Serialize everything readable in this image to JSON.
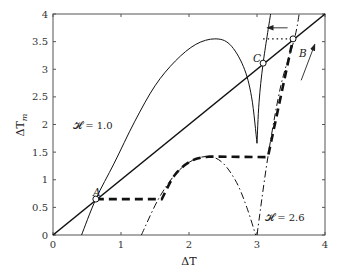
{
  "chart_data": {
    "type": "line",
    "title": "",
    "xlabel": "ΔT",
    "ylabel": "ΔT_m",
    "xlim": [
      0,
      4
    ],
    "ylim": [
      0,
      4
    ],
    "xticks": [
      0,
      1,
      2,
      3,
      4
    ],
    "xtick_labels": [
      "0",
      "1",
      "2",
      "3",
      "4"
    ],
    "yticks": [
      0,
      0.5,
      1,
      1.5,
      2,
      2.5,
      3,
      3.5,
      4
    ],
    "ytick_labels": [
      "0",
      "0.5",
      "1",
      "1.5",
      "2",
      "2.5",
      "3",
      "3.5",
      "4"
    ],
    "grid": false,
    "legend": null,
    "series": [
      {
        "name": "diagonal ΔT_m = ΔT",
        "style": "solid-thick",
        "x": [
          0,
          4
        ],
        "y": [
          0,
          4
        ]
      },
      {
        "name": "H = 1.0 (solid curve)",
        "style": "solid-thin",
        "x": [
          0.42,
          0.63,
          0.9,
          1.2,
          1.5,
          1.8,
          2.1,
          2.38,
          2.6,
          2.8,
          2.92,
          3.0
        ],
        "y": [
          0.0,
          0.65,
          1.3,
          2.05,
          2.7,
          3.15,
          3.45,
          3.55,
          3.45,
          3.05,
          2.5,
          1.66
        ]
      },
      {
        "name": "H = 1.0 (right branch)",
        "style": "solid-thin",
        "x": [
          3.0,
          3.03,
          3.09,
          3.2
        ],
        "y": [
          1.66,
          2.4,
          3.11,
          4.0
        ]
      },
      {
        "name": "H = 2.6 (dash-dot curve)",
        "style": "dash-dot",
        "x": [
          1.3,
          1.55,
          1.8,
          2.05,
          2.3,
          2.5,
          2.7,
          2.85,
          2.98
        ],
        "y": [
          0.0,
          0.65,
          1.1,
          1.35,
          1.42,
          1.3,
          0.95,
          0.5,
          0.0
        ]
      },
      {
        "name": "H = 2.6 (right branch)",
        "style": "dash-dot",
        "x": [
          3.0,
          3.16,
          3.35,
          3.55,
          3.62
        ],
        "y": [
          0.0,
          1.41,
          2.7,
          3.55,
          4.0
        ]
      },
      {
        "name": "hysteresis path (thick dashed)",
        "style": "dashed-thick",
        "x": [
          0.63,
          1.6,
          1.8,
          2.05,
          2.3,
          3.16,
          3.35,
          3.53
        ],
        "y": [
          0.65,
          0.65,
          1.1,
          1.35,
          1.42,
          1.41,
          2.7,
          3.55
        ]
      },
      {
        "name": "jump B→C (dotted)",
        "style": "dotted",
        "x": [
          3.09,
          3.53
        ],
        "y": [
          3.55,
          3.55
        ]
      }
    ],
    "points": [
      {
        "label": "A",
        "x": 0.63,
        "y": 0.65
      },
      {
        "label": "B",
        "x": 3.53,
        "y": 3.55
      },
      {
        "label": "C",
        "x": 3.09,
        "y": 3.11
      }
    ],
    "annotations": [
      {
        "text": "𝓗 = 1.0",
        "x": 0.35,
        "y": 2.0
      },
      {
        "text": "𝓗 = 2.6",
        "x": 3.1,
        "y": 0.22
      },
      {
        "text": "arrow-left",
        "from": [
          3.45,
          3.75
        ],
        "to": [
          3.15,
          3.75
        ]
      },
      {
        "text": "arrow-up",
        "from": [
          3.65,
          2.8
        ],
        "to": [
          3.85,
          3.45
        ]
      }
    ]
  },
  "labels": {
    "xlabel": "ΔT",
    "ylabel_main": "ΔT",
    "ylabel_sub": "m",
    "point_a": "A",
    "point_b": "B",
    "point_c": "C",
    "h1": "𝓗 = 1.0",
    "h2": "𝓗 = 2.6"
  }
}
